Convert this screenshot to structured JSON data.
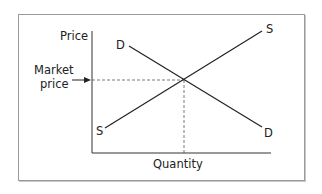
{
  "diagram": {
    "title": "",
    "axes": {
      "y_label": "Price",
      "x_label": "Quantity"
    },
    "curves": [
      {
        "name": "Demand",
        "start_label": "D",
        "end_label": "D"
      },
      {
        "name": "Supply",
        "start_label": "S",
        "end_label": "S"
      }
    ],
    "annotation": {
      "label_line1": "Market",
      "label_line2": "price"
    }
  }
}
